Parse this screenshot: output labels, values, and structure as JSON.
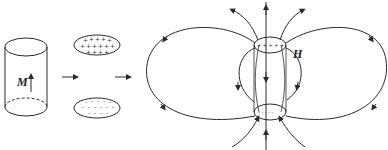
{
  "diagram": {
    "labels": {
      "magnetization": "M",
      "field": "H",
      "positive_pole_symbol": "+",
      "negative_pole_symbol": "-"
    },
    "panels": [
      {
        "id": "cylinder",
        "description": "Uniformly magnetized cylinder with upward magnetization arrow M"
      },
      {
        "id": "pole-surfaces",
        "description": "Top disk with + surface charges, bottom disk with - surface charges"
      },
      {
        "id": "field-lines",
        "description": "H field lines of the cylinder, exiting top and entering bottom outside; pointing downward inside"
      }
    ],
    "colors": {
      "line": "#2a2a2a",
      "background": "#ffffff"
    }
  }
}
